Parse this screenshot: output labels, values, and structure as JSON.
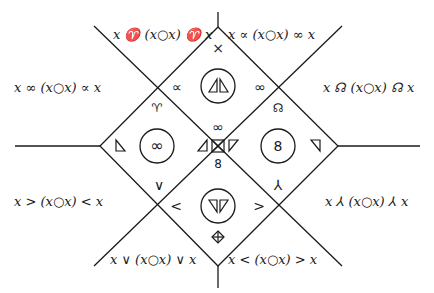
{
  "diagram": {
    "region_labels": {
      "top_left": "x ♈ (x○x) ♈ x",
      "top_right": "x ∝ (x○x) ∞ x",
      "left_upper": "x ∞ (x○x) ∝ x",
      "right_upper": "x ☊ (x○x) ☊ x",
      "left_lower": "x > (x○x) < x",
      "right_lower": "x ⅄ (x○x) ⅄ x",
      "bottom_left": "x ∨ (x○x) ∨ x",
      "bottom_right": "x < (x○x) > x"
    },
    "symbols": {
      "top_apex": "×",
      "upper_left_cross": "∝",
      "upper_right_cross": "∞",
      "upper_left_below": "♈",
      "upper_right_below": "☊",
      "center_top": "∞",
      "center_bottom": "8",
      "lower_left_above": "∨",
      "lower_right_above": "⅄",
      "lower_left_cross": "<",
      "lower_right_cross": ">",
      "bottom_apex": "⊕",
      "left_circle": "∞",
      "right_circle": "8"
    }
  }
}
